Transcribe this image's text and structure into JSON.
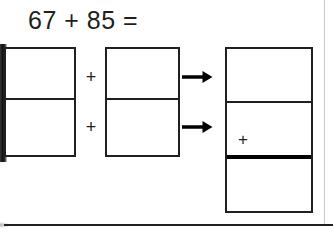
{
  "worksheet": {
    "title": "67 + 85 =",
    "left_box": {
      "name": "addends-box",
      "cells": [
        {
          "value": ""
        },
        {
          "value": ""
        }
      ]
    },
    "middle_box": {
      "name": "operands-box",
      "cells": [
        {
          "value": ""
        },
        {
          "value": ""
        }
      ]
    },
    "right_box": {
      "name": "answer-box",
      "cells": [
        {
          "value": ""
        },
        {
          "value": "+"
        },
        {
          "value": ""
        }
      ]
    },
    "connectors": {
      "plus_top": "+",
      "plus_bottom": "+"
    },
    "arrows": {
      "top": "arrow-right-icon",
      "bottom": "arrow-right-icon"
    },
    "colors": {
      "ink": "#231f20",
      "rule": "#000000",
      "paper": "#ffffff",
      "margin_rule": "#c9c9c9"
    }
  }
}
